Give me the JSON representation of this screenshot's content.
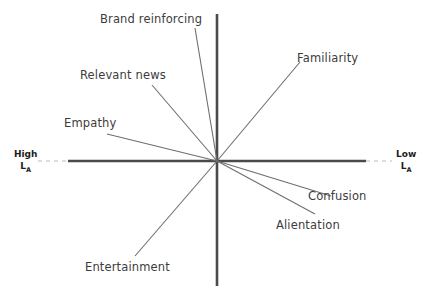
{
  "diagram": {
    "type": "radial-spoke-diagram",
    "background_color": "#ffffff",
    "axis_color": "#4a4a4a",
    "ray_color": "#6e6e6e",
    "dash_color": "#c9b3b3",
    "label_color": "#3c3c3c",
    "axis_label_color": "#1c1c1c",
    "origin": {
      "x": 217,
      "y": 161
    },
    "axes": {
      "horizontal": {
        "solid_start_x": 68,
        "solid_end_x": 366,
        "dash_left_start_x": 38,
        "dash_left_end_x": 68,
        "dash_right_start_x": 366,
        "dash_right_end_x": 392,
        "y": 161
      },
      "vertical": {
        "x": 217,
        "start_y": 14,
        "end_y": 286
      }
    },
    "axis_ends": {
      "left": {
        "line1": "High",
        "line2_base": "L",
        "line2_sub": "A"
      },
      "right": {
        "line1": "Low",
        "line2_base": "L",
        "line2_sub": "A"
      }
    },
    "rays": [
      {
        "name": "brand-reinforcing",
        "label": "Brand reinforcing",
        "end_x": 195,
        "end_y": 28
      },
      {
        "name": "relevant-news",
        "label": "Relevant news",
        "end_x": 152,
        "end_y": 85
      },
      {
        "name": "empathy",
        "label": "Empathy",
        "end_x": 107,
        "end_y": 134
      },
      {
        "name": "familiarity",
        "label": "Familiarity",
        "end_x": 300,
        "end_y": 62
      },
      {
        "name": "confusion",
        "label": "Confusion",
        "end_x": 331,
        "end_y": 196
      },
      {
        "name": "alientation",
        "label": "Alientation",
        "end_x": 315,
        "end_y": 214
      },
      {
        "name": "entertainment",
        "label": "Entertainment",
        "end_x": 135,
        "end_y": 256
      }
    ]
  }
}
